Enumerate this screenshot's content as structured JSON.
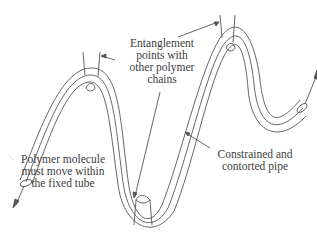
{
  "diagram": {
    "stroke_color": "#555555",
    "labels": {
      "entanglement": {
        "lines": [
          "Entanglement",
          "points with",
          "other polymer",
          "chains"
        ]
      },
      "polymer": {
        "lines": [
          "Polymer molecule",
          "must move within",
          "the fixed tube"
        ]
      },
      "pipe": {
        "lines": [
          "Constrained and",
          "contorted pipe"
        ]
      }
    },
    "icons": {
      "arrow_start": "arrow-down-left",
      "arrow_end": "arrow-up-right"
    }
  }
}
